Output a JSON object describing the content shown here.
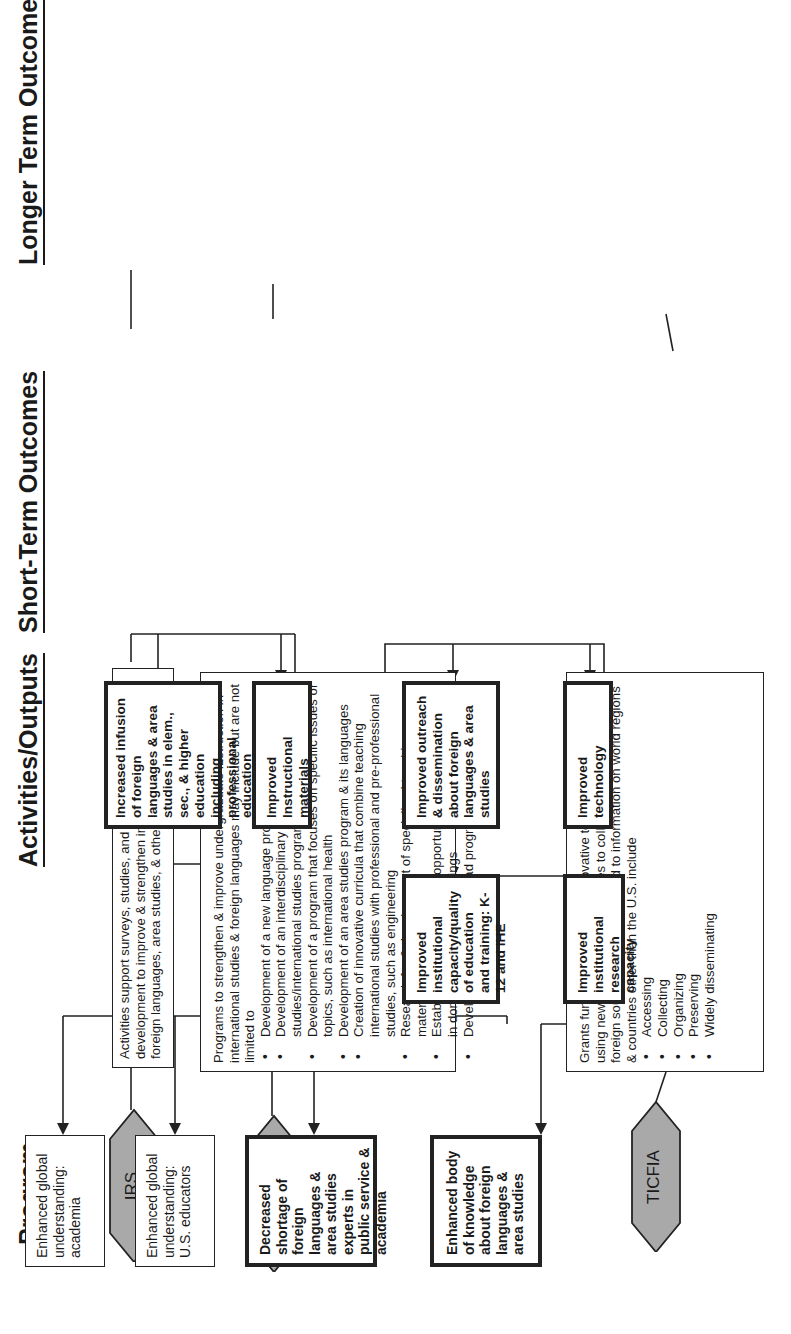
{
  "headings": {
    "program": "Program",
    "activities": "Activities/Outputs",
    "short_term": "Short-Term Outcomes",
    "longer_term": "Longer Term Outcomes"
  },
  "programs": [
    {
      "name": "IRS",
      "shape": "hexagon",
      "fill": "#a9a9a9"
    },
    {
      "name": "UISFL",
      "shape": "hexagon",
      "fill": "#a9a9a9"
    },
    {
      "name": "TICFIA",
      "shape": "hexagon",
      "fill": "#a9a9a9"
    }
  ],
  "activities": {
    "irs": {
      "text": "Activities support surveys, studies, and instructional materials development to improve & strengthen instruction in modern foreign languages, area studies, & other international fields"
    },
    "uisfl": {
      "intro": "Programs to strengthen & improve undergraduate instruction in international studies & foreign languages may include but are not limited to",
      "items": [
        "Development of a new language program",
        "Development of an interdisciplinary global studies/international studies program",
        "Development of a program that focuses on specific issues or topics, such as international health",
        "Development of an area studies program & its languages",
        "Creation of innovative curricula that combine teaching international studies with professional and pre-professional studies, such as engineering",
        "Research for & development of specialized teaching materials",
        "Establishment of internship opportunities for faculty/students in domestic & overseas settings",
        "Development of study-abroad programs"
      ]
    },
    "ticfia": {
      "intro": "Grants fund development of innovative techniques/programs using new electronic technologies to collect information from foreign sources. Activities related to information on world regions & countries other than the U.S. include",
      "items": [
        "Accessing",
        "Collecting",
        "Organizing",
        "Preserving",
        "Widely disseminating"
      ]
    }
  },
  "short_term": [
    {
      "text": "Increased infusion of foreign languages & area studies in elem., sec., & higher education including professional education"
    },
    {
      "text": "Improved Instructional materials"
    },
    {
      "text": "Improved outreach & dissemination about foreign languages & area studies"
    },
    {
      "text": "Improved technology"
    }
  ],
  "intermediate": [
    {
      "text": "Improved institutional capacity/quality of education and training: K-12 and IHE"
    },
    {
      "text": "Improved institutional research capacity"
    }
  ],
  "longer_term": [
    {
      "text": "Enhanced global understanding: academia",
      "emphasis": false
    },
    {
      "text": "Enhanced global understanding: U.S. educators",
      "emphasis": false
    },
    {
      "text": "Decreased shortage of foreign languages & area studies experts in public service & academia",
      "emphasis": true
    },
    {
      "text": "Enhanced body of knowledge about foreign languages & area studies",
      "emphasis": true
    }
  ],
  "colors": {
    "line": "#222222",
    "hex_fill": "#a9a9a9",
    "background": "#ffffff"
  }
}
